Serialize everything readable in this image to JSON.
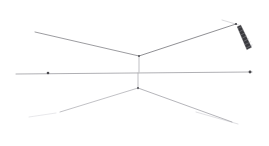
{
  "canvas": {
    "width": 269,
    "height": 146,
    "background": "#ffffff",
    "title": ""
  },
  "palette": {
    "line_primary": "#6e6e72",
    "line_secondary": "#b4b4b8",
    "line_faint": "#d8d8dc",
    "line_ghost": "#ececef",
    "blade_dark": "#3a3a3e",
    "blade_mid": "#6a6a6e",
    "blade_light": "#9a9a9e",
    "node_dark": "#4a4a4e",
    "background": "#ffffff"
  },
  "structure": {
    "upper_vee": {
      "name": "upper-vee-member",
      "apex": {
        "x": 139,
        "y": 56
      },
      "left_end": {
        "x": 35,
        "y": 32
      },
      "right_end": {
        "x": 236,
        "y": 24
      }
    },
    "lower_vee": {
      "name": "lower-lambda-member",
      "apex": {
        "x": 138,
        "y": 88
      },
      "left_end": {
        "x": 60,
        "y": 112
      },
      "right_end": {
        "x": 232,
        "y": 122
      }
    },
    "horizontal_axis": {
      "name": "horizontal-axis-member",
      "left_end": {
        "x": 16,
        "y": 74
      },
      "right_end": {
        "x": 252,
        "y": 72
      }
    },
    "center_stem_upper": {
      "name": "center-stem-upper",
      "top": {
        "x": 139,
        "y": 56
      },
      "bottom": {
        "x": 139,
        "y": 72
      }
    },
    "center_stem_lower": {
      "name": "center-stem-lower",
      "top": {
        "x": 138,
        "y": 73
      },
      "bottom": {
        "x": 138,
        "y": 89
      }
    }
  },
  "nodes": [
    {
      "name": "node-left-axis",
      "x": 48,
      "y": 73,
      "r": 1.3,
      "label": ""
    },
    {
      "name": "node-right-axis",
      "x": 250,
      "y": 72,
      "r": 1.4,
      "label": ""
    },
    {
      "name": "node-upper-apex",
      "x": 139,
      "y": 56,
      "r": 0.9,
      "label": ""
    },
    {
      "name": "node-lower-apex",
      "x": 138,
      "y": 88,
      "r": 0.9,
      "label": ""
    },
    {
      "name": "node-upper-right-tip",
      "x": 236,
      "y": 24,
      "r": 1.1,
      "label": ""
    }
  ],
  "blade": {
    "name": "hatched-blade-element",
    "tip_top": {
      "x": 239,
      "y": 26
    },
    "tip_bottom": {
      "x": 250,
      "y": 48
    },
    "width": 7,
    "hatch_count": 7,
    "fill": "#3a3a3e",
    "description": ""
  },
  "faint_members": [
    {
      "name": "faint-lower-left-strut",
      "from": {
        "x": 29,
        "y": 117
      },
      "to": {
        "x": 56,
        "y": 113
      }
    },
    {
      "name": "faint-lower-right-strut",
      "from": {
        "x": 196,
        "y": 112
      },
      "to": {
        "x": 238,
        "y": 124
      }
    },
    {
      "name": "faint-upper-right-brace",
      "from": {
        "x": 222,
        "y": 20
      },
      "to": {
        "x": 239,
        "y": 25
      }
    }
  ]
}
